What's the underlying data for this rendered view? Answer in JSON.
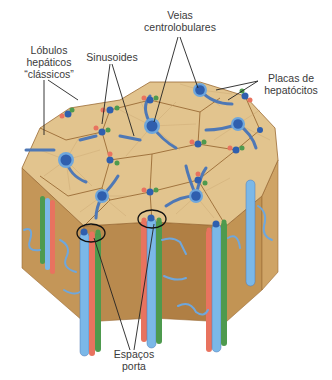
{
  "figure": {
    "labels": {
      "lobulos": "Lóbulos hepáticos “clássicos”",
      "lobulos_line1": "Lóbulos",
      "lobulos_line2": "hepáticos",
      "lobulos_line3": "“clássicos”",
      "sinusoides": "Sinusoides",
      "veias_line1": "Veias",
      "veias_line2": "centrolobulares",
      "placas_line1": "Placas de",
      "placas_line2": "hepatócitos",
      "espacos_line1": "Espaços",
      "espacos_line2": "porta"
    },
    "caption": "",
    "colors": {
      "lobule_top": "#e2c48e",
      "lobule_side": "#c99a5c",
      "lobule_side_dark": "#b5864a",
      "border_line": "#9a6b35",
      "central_vein": "#2f5fae",
      "vein_ring": "#6fa7dc",
      "sinusoid": "#4f78b5",
      "portal_vein": "#7bb8e8",
      "hepatic_artery": "#e8735f",
      "bile_duct": "#4e9a4e",
      "leader_line": "#222222"
    }
  }
}
